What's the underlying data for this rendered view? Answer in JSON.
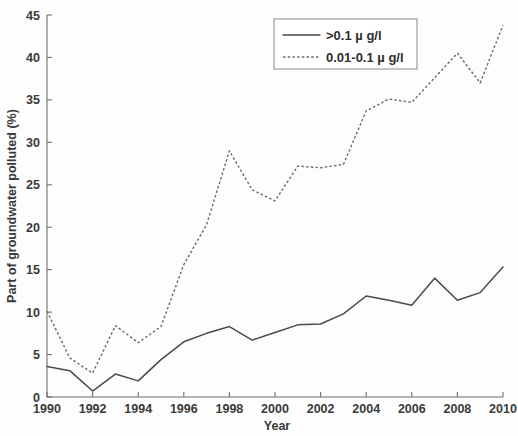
{
  "chart_data": {
    "type": "line",
    "title": "",
    "xlabel": "Year",
    "ylabel": "Part of groundwater polluted (%)",
    "xlim": [
      1990,
      2010
    ],
    "ylim": [
      0,
      45
    ],
    "xticks": [
      1990,
      1992,
      1994,
      1996,
      1998,
      2000,
      2002,
      2004,
      2006,
      2008,
      2010
    ],
    "yticks": [
      0,
      5,
      10,
      15,
      20,
      25,
      30,
      35,
      40,
      45
    ],
    "grid": false,
    "legend_position": "top-right",
    "x": [
      1990,
      1991,
      1992,
      1993,
      1994,
      1995,
      1996,
      1997,
      1998,
      1999,
      2000,
      2001,
      2002,
      2003,
      2004,
      2005,
      2006,
      2007,
      2008,
      2009,
      2010
    ],
    "series": [
      {
        "name": ">0.1 µ g/l",
        "style": "solid",
        "color": "#4a4a4a",
        "values": [
          3.6,
          3.1,
          0.7,
          2.7,
          1.9,
          4.4,
          6.5,
          7.5,
          8.3,
          6.7,
          7.6,
          8.5,
          8.6,
          9.8,
          11.9,
          11.4,
          10.8,
          14.0,
          11.4,
          12.3,
          15.3
        ]
      },
      {
        "name": "0.01-0.1 µ g/l",
        "style": "dotted",
        "color": "#6a6a6a",
        "values": [
          10.1,
          4.6,
          2.8,
          8.4,
          6.4,
          8.3,
          15.6,
          20.3,
          29.0,
          24.4,
          23.1,
          27.2,
          27.0,
          27.4,
          33.7,
          35.1,
          34.7,
          37.6,
          40.5,
          37.0,
          43.8
        ]
      }
    ]
  },
  "axes": {
    "xlabel": "Year",
    "ylabel": "Part of groundwater polluted (%)",
    "xtick_labels": [
      "1990",
      "1992",
      "1994",
      "1996",
      "1998",
      "2000",
      "2002",
      "2004",
      "2006",
      "2008",
      "2010"
    ],
    "ytick_labels": [
      "0",
      "5",
      "10",
      "15",
      "20",
      "25",
      "30",
      "35",
      "40",
      "45"
    ]
  },
  "legend": {
    "entries": [
      {
        "label": ">0.1 µ g/l",
        "style": "solid"
      },
      {
        "label": "0.01-0.1 µ g/l",
        "style": "dotted"
      }
    ]
  }
}
